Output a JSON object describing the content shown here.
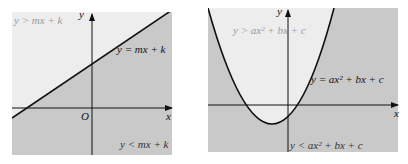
{
  "left_panel": {
    "region_above": "y > mx + k",
    "region_below": "y < mx + k",
    "line_label": "y = mx + k",
    "axis_x": "x",
    "axis_y": "y",
    "origin": "O"
  },
  "right_panel": {
    "region_above": "y > ax² + bx + c",
    "region_below": "y < ax² + bx + c",
    "curve_label": "y = ax² + bx + c",
    "axis_x": "x",
    "axis_y": "y"
  },
  "colors": {
    "light_region": "#ededed",
    "dark_region": "#c9c9c9",
    "line": "#111111",
    "faint_text": "#9a9a9a"
  }
}
